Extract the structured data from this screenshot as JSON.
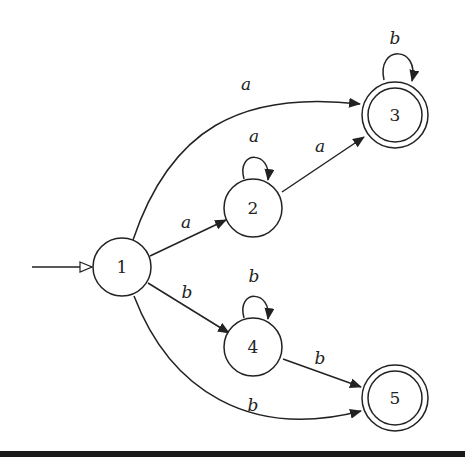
{
  "diagram": {
    "type": "finite-automaton",
    "start_state": "1",
    "states": [
      {
        "id": "1",
        "label": "1",
        "accepting": false,
        "x": 122,
        "y": 267
      },
      {
        "id": "2",
        "label": "2",
        "accepting": false,
        "x": 253,
        "y": 208
      },
      {
        "id": "3",
        "label": "3",
        "accepting": true,
        "x": 395,
        "y": 115
      },
      {
        "id": "4",
        "label": "4",
        "accepting": false,
        "x": 253,
        "y": 347
      },
      {
        "id": "5",
        "label": "5",
        "accepting": true,
        "x": 395,
        "y": 398
      }
    ],
    "transitions": [
      {
        "from": "1",
        "to": "3",
        "label": "a"
      },
      {
        "from": "1",
        "to": "2",
        "label": "a"
      },
      {
        "from": "2",
        "to": "2",
        "label": "a"
      },
      {
        "from": "2",
        "to": "3",
        "label": "a"
      },
      {
        "from": "3",
        "to": "3",
        "label": "b"
      },
      {
        "from": "1",
        "to": "4",
        "label": "b"
      },
      {
        "from": "4",
        "to": "4",
        "label": "b"
      },
      {
        "from": "4",
        "to": "5",
        "label": "b"
      },
      {
        "from": "1",
        "to": "5",
        "label": "b"
      }
    ]
  }
}
